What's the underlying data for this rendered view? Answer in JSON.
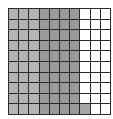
{
  "diagram": {
    "type": "hundred-grid",
    "rows": 10,
    "cols": 10,
    "total_cells": 100,
    "shaded_cells": 71,
    "colors": {
      "light": "#b4b4b4",
      "dark": "#9a9a9a",
      "mid": "#a6a6a6",
      "empty": "#ffffff",
      "border": "#2a2a2a"
    },
    "cells": [
      [
        "light",
        "light",
        "light",
        "dark",
        "dark",
        "dark",
        "dark",
        "empty",
        "empty",
        "empty"
      ],
      [
        "light",
        "light",
        "light",
        "dark",
        "dark",
        "dark",
        "dark",
        "empty",
        "empty",
        "empty"
      ],
      [
        "light",
        "light",
        "light",
        "dark",
        "dark",
        "dark",
        "dark",
        "empty",
        "empty",
        "empty"
      ],
      [
        "light",
        "light",
        "light",
        "dark",
        "dark",
        "dark",
        "dark",
        "empty",
        "empty",
        "empty"
      ],
      [
        "light",
        "light",
        "light",
        "dark",
        "dark",
        "dark",
        "dark",
        "empty",
        "empty",
        "empty"
      ],
      [
        "light",
        "light",
        "light",
        "dark",
        "dark",
        "dark",
        "dark",
        "empty",
        "empty",
        "empty"
      ],
      [
        "light",
        "light",
        "light",
        "dark",
        "dark",
        "dark",
        "dark",
        "empty",
        "empty",
        "empty"
      ],
      [
        "light",
        "light",
        "light",
        "dark",
        "dark",
        "dark",
        "dark",
        "empty",
        "empty",
        "empty"
      ],
      [
        "light",
        "light",
        "light",
        "dark",
        "dark",
        "dark",
        "dark",
        "empty",
        "empty",
        "empty"
      ],
      [
        "light",
        "light",
        "light",
        "dark",
        "dark",
        "dark",
        "dark",
        "mid",
        "empty",
        "empty"
      ]
    ]
  }
}
